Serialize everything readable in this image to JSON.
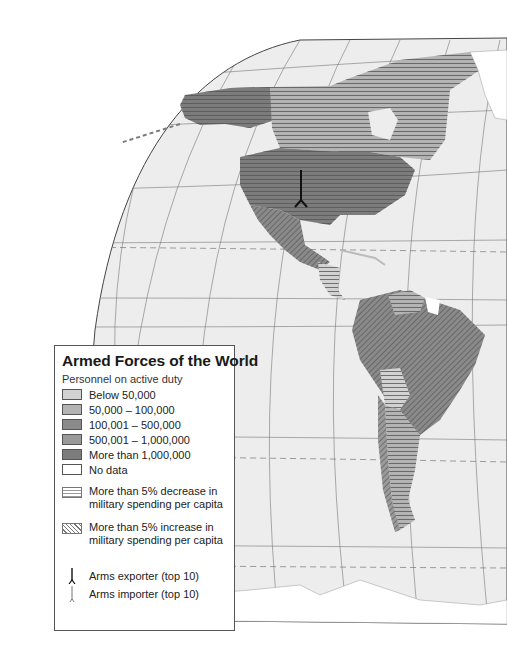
{
  "legend": {
    "title": "Armed Forces of the World",
    "subtitle": "Personnel on active duty",
    "categories": [
      {
        "label": "Below 50,000",
        "color": "#d2d2d2"
      },
      {
        "label": "50,000 – 100,000",
        "color": "#b4b4b4"
      },
      {
        "label": "100,001 – 500,000",
        "color": "#8a8a8a"
      },
      {
        "label": "500,001 – 1,000,000",
        "color": "#9a9a9a"
      },
      {
        "label": "More than 1,000,000",
        "color": "#7c7c7c"
      },
      {
        "label": "No data",
        "color": "#ffffff"
      }
    ],
    "patterns": [
      {
        "label": "More than 5% decrease in military spending per capita",
        "pattern": "horizontal-lines"
      },
      {
        "label": "More than 5% increase in military spending per capita",
        "pattern": "diagonal-lines"
      }
    ],
    "symbols": [
      {
        "label": "Arms exporter (top 10)",
        "icon": "arms-exporter-icon"
      },
      {
        "label": "Arms importer (top 10)",
        "icon": "arms-importer-icon"
      }
    ]
  },
  "map": {
    "region": "Americas",
    "ocean_color": "#ededed",
    "outside_color": "#ffffff",
    "countries": [
      {
        "name": "Alaska (USA)",
        "category": "More than 1,000,000",
        "pattern": "horizontal-lines"
      },
      {
        "name": "Canada",
        "category": "50,000 – 100,000",
        "pattern": "horizontal-lines"
      },
      {
        "name": "Greenland",
        "category": "No data",
        "pattern": "none"
      },
      {
        "name": "United States",
        "category": "More than 1,000,000",
        "pattern": "horizontal-lines",
        "symbol": "Arms exporter (top 10)"
      },
      {
        "name": "Mexico",
        "category": "100,001 – 500,000",
        "pattern": "diagonal-lines"
      },
      {
        "name": "Central America",
        "category": "Below 50,000",
        "pattern": "horizontal-lines"
      },
      {
        "name": "Colombia",
        "category": "100,001 – 500,000",
        "pattern": "diagonal-lines"
      },
      {
        "name": "Venezuela",
        "category": "50,000 – 100,000",
        "pattern": "horizontal-lines"
      },
      {
        "name": "Guyana / Suriname",
        "category": "No data",
        "pattern": "none"
      },
      {
        "name": "Brazil",
        "category": "100,001 – 500,000",
        "pattern": "diagonal-lines"
      },
      {
        "name": "Peru",
        "category": "100,001 – 500,000",
        "pattern": "diagonal-lines"
      },
      {
        "name": "Bolivia",
        "category": "Below 50,000",
        "pattern": "horizontal-lines"
      },
      {
        "name": "Chile",
        "category": "50,000 – 100,000",
        "pattern": "diagonal-lines"
      },
      {
        "name": "Argentina",
        "category": "50,000 – 100,000",
        "pattern": "horizontal-lines"
      },
      {
        "name": "Paraguay / Uruguay",
        "category": "Below 50,000",
        "pattern": "horizontal-lines"
      },
      {
        "name": "Antarctica",
        "category": "No data",
        "pattern": "none"
      }
    ]
  }
}
